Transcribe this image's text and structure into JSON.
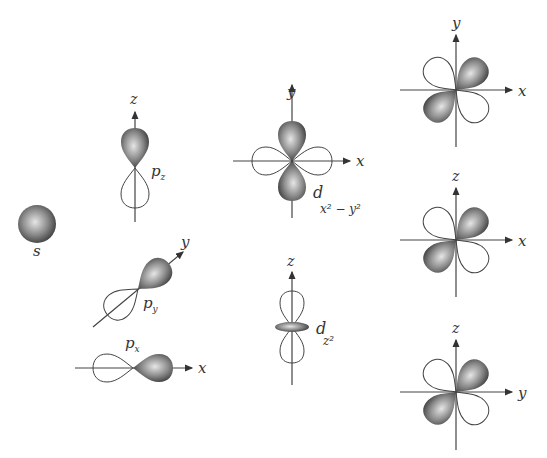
{
  "colors": {
    "lobe_dark": "#3a3a3a",
    "lobe_light": "#d8d8d8",
    "axis": "#444444",
    "outline": "#444444"
  },
  "orbitals": {
    "s": {
      "label": "s"
    },
    "pz": {
      "label": "p",
      "sub": "z",
      "axis": "z"
    },
    "py": {
      "label": "p",
      "sub": "y",
      "axis": "y"
    },
    "px": {
      "label": "p",
      "sub": "x",
      "axis": "x"
    },
    "dx2y2": {
      "label": "d",
      "sub": "x² − y²",
      "axis_h": "x",
      "axis_v": "y"
    },
    "dz2": {
      "label": "d",
      "sub": "z²",
      "axis": "z"
    },
    "dxy": {
      "axis_h": "x",
      "axis_v": "y"
    },
    "dxz": {
      "axis_h": "x",
      "axis_v": "z"
    },
    "dyz": {
      "axis_h": "y",
      "axis_v": "z"
    }
  }
}
